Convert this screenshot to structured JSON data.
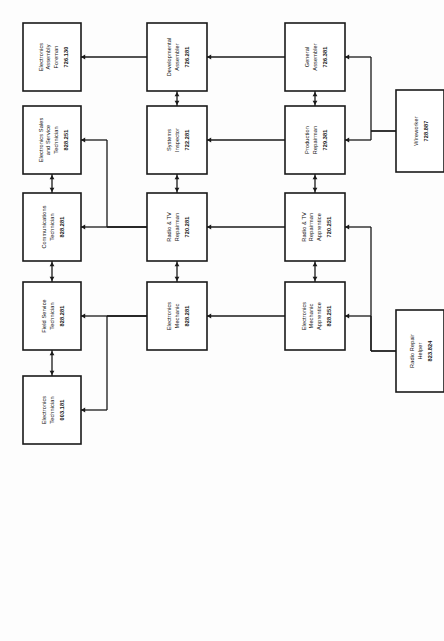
{
  "diagram": {
    "orientation": "rotated-90-ccw",
    "tiers": [
      {
        "id": "tier-4",
        "name": "Advanced / Supervisory"
      },
      {
        "id": "tier-3",
        "name": "Journeyman"
      },
      {
        "id": "tier-2",
        "name": "Intermediate"
      },
      {
        "id": "tier-1",
        "name": "Entry"
      }
    ],
    "nodes": [
      {
        "id": "electronics-assembly-foreman",
        "tier": 4,
        "col": 1,
        "lines": [
          "Electronics",
          "Assembly",
          "Foreman"
        ],
        "code": "726.130"
      },
      {
        "id": "electronics-sales-and-service-technician",
        "tier": 4,
        "col": 2,
        "lines": [
          "Electronics Sales",
          "and Service",
          "Technician"
        ],
        "code": "828.251"
      },
      {
        "id": "communications-technician",
        "tier": 4,
        "col": 3,
        "lines": [
          "Communications",
          "Technician"
        ],
        "code": "828.281"
      },
      {
        "id": "field-service-technician",
        "tier": 4,
        "col": 4,
        "lines": [
          "Field Service",
          "Technician"
        ],
        "code": "828.281"
      },
      {
        "id": "electronics-technician",
        "tier": 4,
        "col": 5,
        "lines": [
          "Electronics",
          "Technician"
        ],
        "code": "003.181"
      },
      {
        "id": "developmental-assembler",
        "tier": 3,
        "col": 1,
        "lines": [
          "Developmental",
          "Assembler"
        ],
        "code": "726.281"
      },
      {
        "id": "systems-inspector",
        "tier": 3,
        "col": 2,
        "lines": [
          "Systems",
          "Inspector"
        ],
        "code": "722.281"
      },
      {
        "id": "radio-and-tv-repairman",
        "tier": 3,
        "col": 3,
        "lines": [
          "Radio & TV",
          "Repairman"
        ],
        "code": "720.281"
      },
      {
        "id": "electronics-mechanic",
        "tier": 3,
        "col": 4,
        "lines": [
          "Electronics",
          "Mechanic"
        ],
        "code": "828.281"
      },
      {
        "id": "general-assembler",
        "tier": 2,
        "col": 1,
        "lines": [
          "General",
          "Assembler"
        ],
        "code": "726.381"
      },
      {
        "id": "production-repairman",
        "tier": 2,
        "col": 2,
        "lines": [
          "Production",
          "Repairman"
        ],
        "code": "729.381"
      },
      {
        "id": "radio-and-tv-repairman-apprentice",
        "tier": 2,
        "col": 3,
        "lines": [
          "Radio & TV",
          "Repairman",
          "Apprentice"
        ],
        "code": "720.251"
      },
      {
        "id": "electronics-mechanic-apprentice",
        "tier": 2,
        "col": 4,
        "lines": [
          "Electronics",
          "Mechanic",
          "Apprentice"
        ],
        "code": "828.251"
      },
      {
        "id": "wireworker",
        "tier": 1,
        "col": 1,
        "lines": [
          "Wireworker"
        ],
        "code": "728.887"
      },
      {
        "id": "radio-repair-helper",
        "tier": 1,
        "col": 2,
        "lines": [
          "Radio Repair",
          "Helper"
        ],
        "code": "823.824"
      }
    ],
    "edges": [
      {
        "id": "wireworker-to-general-assembler",
        "from": "wireworker",
        "to": "general-assembler",
        "style": "branch",
        "arrow": "single"
      },
      {
        "id": "wireworker-to-production-repairman",
        "from": "wireworker",
        "to": "production-repairman",
        "style": "branch",
        "arrow": "single"
      },
      {
        "id": "radio-repair-helper-to-radio-and-tv-repairman-apprentice",
        "from": "radio-repair-helper",
        "to": "radio-and-tv-repairman-apprentice",
        "style": "branch",
        "arrow": "single"
      },
      {
        "id": "radio-repair-helper-to-electronics-mechanic-apprentice",
        "from": "radio-repair-helper",
        "to": "electronics-mechanic-apprentice",
        "style": "branch",
        "arrow": "single"
      },
      {
        "id": "general-assembler-to-production-repairman",
        "from": "general-assembler",
        "to": "production-repairman",
        "style": "lateral",
        "arrow": "double"
      },
      {
        "id": "production-repairman-to-radio-and-tv-repairman-apprentice",
        "from": "production-repairman",
        "to": "radio-and-tv-repairman-apprentice",
        "style": "lateral",
        "arrow": "double"
      },
      {
        "id": "radio-and-tv-repairman-apprentice-to-electronics-mechanic-apprentice",
        "from": "radio-and-tv-repairman-apprentice",
        "to": "electronics-mechanic-apprentice",
        "style": "lateral",
        "arrow": "double"
      },
      {
        "id": "general-assembler-to-developmental-assembler",
        "from": "general-assembler",
        "to": "developmental-assembler",
        "style": "vertical",
        "arrow": "single"
      },
      {
        "id": "production-repairman-to-systems-inspector",
        "from": "production-repairman",
        "to": "systems-inspector",
        "style": "vertical",
        "arrow": "single"
      },
      {
        "id": "radio-and-tv-repairman-apprentice-to-radio-and-tv-repairman",
        "from": "radio-and-tv-repairman-apprentice",
        "to": "radio-and-tv-repairman",
        "style": "vertical",
        "arrow": "single"
      },
      {
        "id": "electronics-mechanic-apprentice-to-electronics-mechanic",
        "from": "electronics-mechanic-apprentice",
        "to": "electronics-mechanic",
        "style": "vertical",
        "arrow": "single"
      },
      {
        "id": "developmental-assembler-to-systems-inspector",
        "from": "developmental-assembler",
        "to": "systems-inspector",
        "style": "lateral",
        "arrow": "double"
      },
      {
        "id": "systems-inspector-to-radio-and-tv-repairman",
        "from": "systems-inspector",
        "to": "radio-and-tv-repairman",
        "style": "lateral",
        "arrow": "double"
      },
      {
        "id": "radio-and-tv-repairman-to-electronics-mechanic",
        "from": "radio-and-tv-repairman",
        "to": "electronics-mechanic",
        "style": "lateral",
        "arrow": "double"
      },
      {
        "id": "developmental-assembler-to-electronics-assembly-foreman",
        "from": "developmental-assembler",
        "to": "electronics-assembly-foreman",
        "style": "vertical",
        "arrow": "single"
      },
      {
        "id": "radio-and-tv-repairman-to-electronics-sales-and-service-technician",
        "from": "radio-and-tv-repairman",
        "to": "electronics-sales-and-service-technician",
        "style": "branch",
        "arrow": "single"
      },
      {
        "id": "radio-and-tv-repairman-to-communications-technician",
        "from": "radio-and-tv-repairman",
        "to": "communications-technician",
        "style": "branch",
        "arrow": "single"
      },
      {
        "id": "electronics-mechanic-to-field-service-technician",
        "from": "electronics-mechanic",
        "to": "field-service-technician",
        "style": "branch",
        "arrow": "single"
      },
      {
        "id": "electronics-mechanic-to-electronics-technician",
        "from": "electronics-mechanic",
        "to": "electronics-technician",
        "style": "branch",
        "arrow": "single"
      },
      {
        "id": "electronics-sales-and-service-technician-to-communications-technician",
        "from": "electronics-sales-and-service-technician",
        "to": "communications-technician",
        "style": "lateral",
        "arrow": "double"
      },
      {
        "id": "communications-technician-to-field-service-technician",
        "from": "communications-technician",
        "to": "field-service-technician",
        "style": "lateral",
        "arrow": "double"
      },
      {
        "id": "field-service-technician-to-electronics-technician",
        "from": "field-service-technician",
        "to": "electronics-technician",
        "style": "lateral",
        "arrow": "double"
      }
    ]
  }
}
